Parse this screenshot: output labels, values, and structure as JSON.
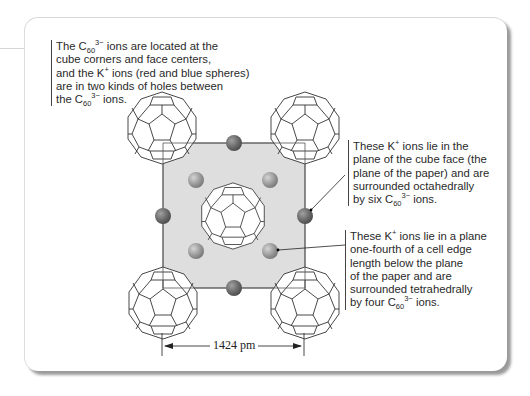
{
  "figure": {
    "caption_top": {
      "lines": [
        {
          "pre": "The C",
          "sub": "60",
          "sup": "3−",
          "post": " ions are located at the"
        },
        {
          "pre": "cube corners and face centers,"
        },
        {
          "pre": "and the K",
          "sup": "+",
          "post": " ions (red and blue spheres)"
        },
        {
          "pre": "are in two kinds of holes between"
        },
        {
          "pre": "the C",
          "sub": "60",
          "sup": "3−",
          "post": " ions."
        }
      ]
    },
    "callout_octahedral": {
      "lines": [
        {
          "pre": "These K",
          "sup": "+",
          "post": " ions lie in the"
        },
        {
          "pre": "plane of the cube face (the"
        },
        {
          "pre": "plane of the paper) and are"
        },
        {
          "pre": "surrounded octahedrally"
        },
        {
          "pre": "by six C",
          "sub": "60",
          "sup": "3−",
          "post": " ions."
        }
      ]
    },
    "callout_tetrahedral": {
      "lines": [
        {
          "pre": "These K",
          "sup": "+",
          "post": " ions lie in a plane"
        },
        {
          "pre": "one-fourth of a cell edge"
        },
        {
          "pre": "length below the plane"
        },
        {
          "pre": "of the paper and are"
        },
        {
          "pre": "surrounded tetrahedrally"
        },
        {
          "pre": "by four C",
          "sub": "60",
          "sup": "3−",
          "post": " ions."
        }
      ]
    },
    "dimension": {
      "label": "1424 pm",
      "value": 1424,
      "unit": "pm"
    },
    "colors": {
      "face": "#dcdcdc",
      "octahedral_ion": "#6e6e6e",
      "tetrahedral_ion": "#9c9c9c",
      "line": "#333333"
    },
    "structure": {
      "c60_positions": [
        "corner-top-left",
        "corner-top-right",
        "corner-bottom-left",
        "corner-bottom-right",
        "face-center"
      ],
      "octahedral_k_count_shown": 4,
      "tetrahedral_k_count_shown": 4
    }
  }
}
